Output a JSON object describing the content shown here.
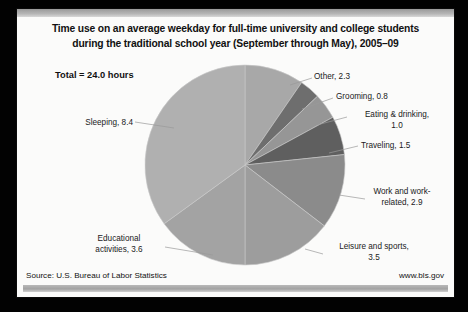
{
  "slide": {
    "title_line1": "Time use on an average weekday for full-time university and college students",
    "title_line2": "during the traditional school year (September through May), 2005–09",
    "total_note": "Total = 24.0 hours",
    "source": "Source: U.S. Bureau of Labor Statistics",
    "website": "www.bls.gov"
  },
  "chart_data": {
    "type": "pie",
    "title": "Time use on an average weekday for full-time university and college students during the traditional school year (September through May), 2005–09",
    "unit": "hours",
    "total": 24.0,
    "total_label": "Total = 24.0 hours",
    "start_angle_deg": 0,
    "direction": "clockwise",
    "legend": "none (direct labels with leader lines)",
    "categories": [
      "Other",
      "Grooming",
      "Eating & drinking",
      "Traveling",
      "Work and work-related",
      "Leisure and sports",
      "Educational activities",
      "Sleeping"
    ],
    "values": [
      2.3,
      0.8,
      1.0,
      1.5,
      2.9,
      3.5,
      3.6,
      8.4
    ],
    "slices": [
      {
        "label": "Other",
        "value": 2.3,
        "value_text": "2.3",
        "label_text": "Other, 2.3",
        "color": "#a8a8a8"
      },
      {
        "label": "Grooming",
        "value": 0.8,
        "value_text": "0.8",
        "label_text": "Grooming, 0.8",
        "color": "#6e6e6e"
      },
      {
        "label": "Eating & drinking",
        "value": 1.0,
        "value_text": "1.0",
        "label_text_l1": "Eating & drinking,",
        "label_text_l2": "1.0",
        "color": "#969696"
      },
      {
        "label": "Traveling",
        "value": 1.5,
        "value_text": "1.5",
        "label_text": "Traveling, 1.5",
        "color": "#5f5f5f"
      },
      {
        "label": "Work and work-related",
        "value": 2.9,
        "value_text": "2.9",
        "label_text_l1": "Work and work-",
        "label_text_l2": "related, 2.9",
        "color": "#8b8b8b"
      },
      {
        "label": "Leisure and sports",
        "value": 3.5,
        "value_text": "3.5",
        "label_text_l1": "Leisure and sports,",
        "label_text_l2": "3.5",
        "color": "#9d9d9d"
      },
      {
        "label": "Educational activities",
        "value": 3.6,
        "value_text": "3.6",
        "label_text_l1": "Educational",
        "label_text_l2": "activities, 3.6",
        "color": "#a3a3a3"
      },
      {
        "label": "Sleeping",
        "value": 8.4,
        "value_text": "8.4",
        "label_text": "Sleeping, 8.4",
        "color": "#b0b0b0"
      }
    ]
  }
}
